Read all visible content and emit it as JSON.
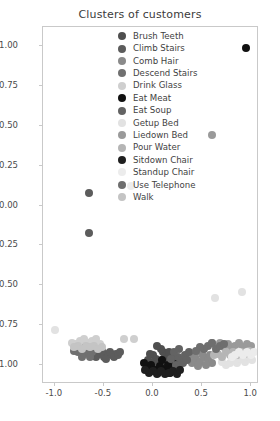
{
  "chart_data": {
    "type": "scatter",
    "title": "Clusters of customers",
    "xlabel": "",
    "ylabel": "",
    "xlim": [
      -1.12,
      1.08
    ],
    "ylim": [
      -1.12,
      1.12
    ],
    "grid": false,
    "legend_position": "upper center",
    "xticks": [
      "-1.0",
      "-0.5",
      "0.0",
      "0.5",
      "1.0"
    ],
    "xtickvalues": [
      -1.0,
      -0.5,
      0.0,
      0.5,
      1.0
    ],
    "yticks": [
      "1.00",
      "0.75",
      "0.50",
      "0.25",
      "0.00",
      "-0.25",
      "-0.50",
      "-0.75",
      "-1.00"
    ],
    "ytickvalues": [
      1.0,
      0.75,
      0.5,
      0.25,
      0.0,
      -0.25,
      -0.5,
      -0.75,
      -1.0
    ],
    "series": [
      {
        "name": "Brush Teeth",
        "color": "#4f4f4f",
        "points": [
          [
            0.03,
            -0.96
          ],
          [
            0.06,
            -0.99
          ],
          [
            0.0,
            -0.94
          ],
          [
            0.09,
            -0.97
          ],
          [
            -0.02,
            -0.99
          ],
          [
            0.12,
            -0.95
          ],
          [
            0.05,
            -1.01
          ],
          [
            0.15,
            -0.98
          ],
          [
            -0.05,
            -0.97
          ],
          [
            0.1,
            -0.92
          ],
          [
            0.17,
            -1.0
          ],
          [
            0.01,
            -1.02
          ],
          [
            0.08,
            -0.9
          ],
          [
            0.13,
            -1.02
          ],
          [
            -0.03,
            -0.93
          ],
          [
            0.19,
            -0.95
          ],
          [
            0.04,
            -0.88
          ],
          [
            0.21,
            -0.99
          ],
          [
            0.16,
            -0.92
          ],
          [
            0.11,
            -1.04
          ]
        ]
      },
      {
        "name": "Climb Stairs",
        "color": "#5c5c5c",
        "points": [
          [
            -0.65,
            0.08
          ],
          [
            -0.65,
            -0.17
          ],
          [
            -0.55,
            -0.93
          ],
          [
            -0.5,
            -0.95
          ],
          [
            -0.46,
            -0.93
          ],
          [
            -0.42,
            -0.94
          ],
          [
            -0.38,
            -0.93
          ],
          [
            -0.6,
            -0.92
          ],
          [
            -0.58,
            -0.95
          ],
          [
            -0.52,
            -0.91
          ],
          [
            -0.48,
            -0.96
          ],
          [
            -0.44,
            -0.92
          ],
          [
            -0.4,
            -0.95
          ],
          [
            -0.36,
            -0.94
          ],
          [
            -0.63,
            -0.94
          ],
          [
            -0.34,
            -0.92
          ]
        ]
      },
      {
        "name": "Comb Hair",
        "color": "#8a8a8a",
        "points": [
          [
            0.44,
            -0.96
          ],
          [
            0.48,
            -0.98
          ],
          [
            0.52,
            -0.95
          ],
          [
            0.4,
            -0.99
          ],
          [
            0.56,
            -0.97
          ],
          [
            0.36,
            -0.96
          ],
          [
            0.6,
            -0.99
          ],
          [
            0.46,
            -1.01
          ],
          [
            0.5,
            -0.93
          ],
          [
            0.54,
            -1.0
          ],
          [
            0.42,
            -0.94
          ],
          [
            0.58,
            -0.94
          ]
        ]
      },
      {
        "name": "Descend Stairs",
        "color": "#707070",
        "points": [
          [
            -0.74,
            -0.9
          ],
          [
            -0.7,
            -0.93
          ],
          [
            -0.66,
            -0.91
          ],
          [
            -0.78,
            -0.88
          ],
          [
            -0.62,
            -0.92
          ],
          [
            -0.72,
            -0.95
          ],
          [
            -0.68,
            -0.87
          ],
          [
            -0.76,
            -0.92
          ],
          [
            -0.64,
            -0.95
          ],
          [
            -0.8,
            -0.91
          ]
        ]
      },
      {
        "name": "Drink Glass",
        "color": "#cfcfcf",
        "points": [
          [
            -0.74,
            -0.85
          ],
          [
            -0.7,
            -0.84
          ],
          [
            -0.78,
            -0.87
          ],
          [
            -0.66,
            -0.86
          ],
          [
            -0.62,
            -0.85
          ],
          [
            -0.58,
            -0.84
          ],
          [
            -0.3,
            -0.84
          ],
          [
            -0.19,
            -0.84
          ],
          [
            -0.82,
            -0.86
          ],
          [
            -0.54,
            -0.87
          ]
        ]
      },
      {
        "name": "Eat Meat",
        "color": "#111111",
        "points": [
          [
            0.95,
            0.99
          ],
          [
            -0.02,
            -1.0
          ],
          [
            0.02,
            -1.03
          ],
          [
            0.07,
            -1.01
          ],
          [
            -0.06,
            -1.02
          ],
          [
            0.11,
            -1.03
          ],
          [
            0.15,
            -1.0
          ],
          [
            0.19,
            -1.02
          ],
          [
            0.23,
            -0.99
          ],
          [
            0.05,
            -1.05
          ],
          [
            -0.09,
            -0.99
          ],
          [
            0.27,
            -1.01
          ],
          [
            0.17,
            -1.05
          ],
          [
            0.09,
            -0.97
          ]
        ]
      },
      {
        "name": "Eat Soup",
        "color": "#636363",
        "points": [
          [
            0.25,
            -0.95
          ],
          [
            0.29,
            -0.97
          ],
          [
            0.21,
            -0.92
          ],
          [
            0.33,
            -0.94
          ],
          [
            0.18,
            -0.96
          ],
          [
            0.31,
            -0.99
          ],
          [
            0.27,
            -0.9
          ],
          [
            0.35,
            -0.97
          ],
          [
            0.23,
            -1.0
          ],
          [
            0.37,
            -0.92
          ]
        ]
      },
      {
        "name": "Getup Bed",
        "color": "#e2e2e2",
        "points": [
          [
            -1.0,
            -0.78
          ],
          [
            0.63,
            -0.58
          ],
          [
            0.91,
            -0.54
          ],
          [
            0.82,
            -0.97
          ],
          [
            0.86,
            -0.99
          ],
          [
            0.9,
            -0.96
          ],
          [
            0.94,
            -0.98
          ],
          [
            0.78,
            -0.99
          ],
          [
            0.98,
            -0.95
          ],
          [
            0.74,
            -1.0
          ],
          [
            1.01,
            -0.97
          ],
          [
            0.7,
            -0.98
          ]
        ]
      },
      {
        "name": "Liedown Bed",
        "color": "#9a9a9a",
        "points": [
          [
            0.6,
            0.44
          ],
          [
            0.64,
            -0.88
          ],
          [
            0.68,
            -0.86
          ],
          [
            0.72,
            -0.89
          ],
          [
            0.76,
            -0.87
          ],
          [
            0.8,
            -0.9
          ],
          [
            0.84,
            -0.88
          ],
          [
            0.88,
            -0.86
          ],
          [
            0.92,
            -0.89
          ],
          [
            0.96,
            -0.87
          ],
          [
            1.0,
            -0.88
          ],
          [
            0.6,
            -0.86
          ]
        ]
      },
      {
        "name": "Pour Water",
        "color": "#b5b5b5",
        "points": [
          [
            0.66,
            -0.93
          ],
          [
            0.7,
            -0.95
          ],
          [
            0.74,
            -0.92
          ],
          [
            0.78,
            -0.94
          ],
          [
            0.82,
            -0.92
          ],
          [
            0.86,
            -0.94
          ],
          [
            0.9,
            -0.92
          ],
          [
            0.94,
            -0.93
          ],
          [
            0.62,
            -0.94
          ],
          [
            0.98,
            -0.91
          ]
        ]
      },
      {
        "name": "Sitdown Chair",
        "color": "#1f1f1f",
        "points": [
          [
            0.0,
            -1.04
          ],
          [
            0.04,
            -1.06
          ],
          [
            0.08,
            -1.04
          ],
          [
            0.12,
            -1.06
          ],
          [
            -0.04,
            -1.05
          ],
          [
            0.16,
            -1.05
          ],
          [
            0.2,
            -1.04
          ],
          [
            -0.08,
            -1.03
          ],
          [
            0.24,
            -1.06
          ],
          [
            0.28,
            -1.03
          ]
        ]
      },
      {
        "name": "Standup Chair",
        "color": "#ececec",
        "points": [
          [
            -0.22,
            0.12
          ],
          [
            0.88,
            -0.92
          ],
          [
            0.92,
            -0.94
          ],
          [
            0.96,
            -0.92
          ],
          [
            1.0,
            -0.94
          ],
          [
            0.84,
            -0.94
          ],
          [
            1.03,
            -0.92
          ],
          [
            0.8,
            -0.95
          ]
        ]
      },
      {
        "name": "Use Telephone",
        "color": "#6e6e6e",
        "points": [
          [
            0.56,
            -0.88
          ],
          [
            0.52,
            -0.9
          ],
          [
            0.6,
            -0.86
          ],
          [
            0.64,
            -0.9
          ],
          [
            0.48,
            -0.89
          ],
          [
            0.68,
            -0.88
          ],
          [
            0.44,
            -0.91
          ],
          [
            0.72,
            -0.87
          ]
        ]
      },
      {
        "name": "Walk",
        "color": "#c4c4c4",
        "points": [
          [
            -0.76,
            -0.88
          ],
          [
            -0.72,
            -0.9
          ],
          [
            -0.68,
            -0.88
          ],
          [
            -0.64,
            -0.89
          ],
          [
            -0.6,
            -0.88
          ],
          [
            -0.56,
            -0.9
          ],
          [
            -0.8,
            -0.89
          ],
          [
            -0.52,
            -0.89
          ]
        ]
      }
    ]
  }
}
